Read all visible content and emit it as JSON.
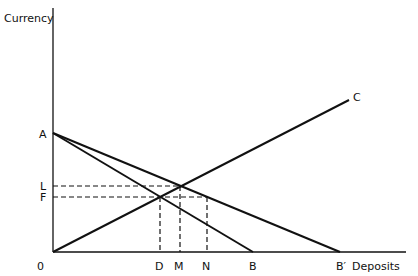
{
  "diagram": {
    "y_axis_label": "Currency",
    "x_axis_label": "Deposits",
    "origin_label": "0",
    "points": {
      "A": "A",
      "C": "C",
      "L": "L",
      "F": "F",
      "D": "D",
      "M": "M",
      "N": "N",
      "B": "B",
      "B_prime": "B′"
    },
    "lines": [
      {
        "name": "AB",
        "from": "A",
        "to": "B"
      },
      {
        "name": "AB'",
        "from": "A",
        "to": "B′"
      },
      {
        "name": "0C",
        "from": "0",
        "to": "C"
      }
    ],
    "dashed_guides": [
      {
        "from": "L",
        "to": "M"
      },
      {
        "from": "F",
        "to": "N"
      },
      {
        "from": "F-intersection",
        "to": "D"
      }
    ]
  }
}
